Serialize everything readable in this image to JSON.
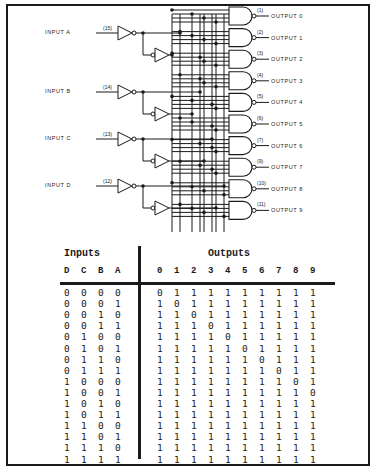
{
  "diagram": {
    "inputs": [
      {
        "label": "INPUT A",
        "pin": "(15)"
      },
      {
        "label": "INPUT B",
        "pin": "(14)"
      },
      {
        "label": "INPUT C",
        "pin": "(13)"
      },
      {
        "label": "INPUT D",
        "pin": "(12)"
      }
    ],
    "outputs": [
      {
        "label": "OUTPUT 0",
        "pin": "(1)"
      },
      {
        "label": "OUTPUT 1",
        "pin": "(2)"
      },
      {
        "label": "OUTPUT 2",
        "pin": "(3)"
      },
      {
        "label": "OUTPUT 3",
        "pin": "(4)"
      },
      {
        "label": "OUTPUT 4",
        "pin": "(5)"
      },
      {
        "label": "OUTPUT 5",
        "pin": "(6)"
      },
      {
        "label": "OUTPUT 6",
        "pin": "(7)"
      },
      {
        "label": "OUTPUT 7",
        "pin": "(9)"
      },
      {
        "label": "OUTPUT 8",
        "pin": "(10)"
      },
      {
        "label": "OUTPUT 9",
        "pin": "(11)"
      }
    ]
  },
  "truth_table": {
    "inputs_title": "Inputs",
    "outputs_title": "Outputs",
    "input_headers": [
      "D",
      "C",
      "B",
      "A"
    ],
    "output_headers": [
      "0",
      "1",
      "2",
      "3",
      "4",
      "5",
      "6",
      "7",
      "8",
      "9"
    ],
    "rows": [
      {
        "in": [
          "0",
          "0",
          "0",
          "0"
        ],
        "out": [
          "0",
          "1",
          "1",
          "1",
          "1",
          "1",
          "1",
          "1",
          "1",
          "1"
        ]
      },
      {
        "in": [
          "0",
          "0",
          "0",
          "1"
        ],
        "out": [
          "1",
          "0",
          "1",
          "1",
          "1",
          "1",
          "1",
          "1",
          "1",
          "1"
        ]
      },
      {
        "in": [
          "0",
          "0",
          "1",
          "0"
        ],
        "out": [
          "1",
          "1",
          "0",
          "1",
          "1",
          "1",
          "1",
          "1",
          "1",
          "1"
        ]
      },
      {
        "in": [
          "0",
          "0",
          "1",
          "1"
        ],
        "out": [
          "1",
          "1",
          "1",
          "0",
          "1",
          "1",
          "1",
          "1",
          "1",
          "1"
        ]
      },
      {
        "in": [
          "0",
          "1",
          "0",
          "0"
        ],
        "out": [
          "1",
          "1",
          "1",
          "1",
          "0",
          "1",
          "1",
          "1",
          "1",
          "1"
        ]
      },
      {
        "in": [
          "0",
          "1",
          "0",
          "1"
        ],
        "out": [
          "1",
          "1",
          "1",
          "1",
          "1",
          "0",
          "1",
          "1",
          "1",
          "1"
        ]
      },
      {
        "in": [
          "0",
          "1",
          "1",
          "0"
        ],
        "out": [
          "1",
          "1",
          "1",
          "1",
          "1",
          "1",
          "0",
          "1",
          "1",
          "1"
        ]
      },
      {
        "in": [
          "0",
          "1",
          "1",
          "1"
        ],
        "out": [
          "1",
          "1",
          "1",
          "1",
          "1",
          "1",
          "1",
          "0",
          "1",
          "1"
        ]
      },
      {
        "in": [
          "1",
          "0",
          "0",
          "0"
        ],
        "out": [
          "1",
          "1",
          "1",
          "1",
          "1",
          "1",
          "1",
          "1",
          "0",
          "1"
        ]
      },
      {
        "in": [
          "1",
          "0",
          "0",
          "1"
        ],
        "out": [
          "1",
          "1",
          "1",
          "1",
          "1",
          "1",
          "1",
          "1",
          "1",
          "0"
        ]
      },
      {
        "in": [
          "1",
          "0",
          "1",
          "0"
        ],
        "out": [
          "1",
          "1",
          "1",
          "1",
          "1",
          "1",
          "1",
          "1",
          "1",
          "1"
        ]
      },
      {
        "in": [
          "1",
          "0",
          "1",
          "1"
        ],
        "out": [
          "1",
          "1",
          "1",
          "1",
          "1",
          "1",
          "1",
          "1",
          "1",
          "1"
        ]
      },
      {
        "in": [
          "1",
          "1",
          "0",
          "0"
        ],
        "out": [
          "1",
          "1",
          "1",
          "1",
          "1",
          "1",
          "1",
          "1",
          "1",
          "1"
        ]
      },
      {
        "in": [
          "1",
          "1",
          "0",
          "1"
        ],
        "out": [
          "1",
          "1",
          "1",
          "1",
          "1",
          "1",
          "1",
          "1",
          "1",
          "1"
        ]
      },
      {
        "in": [
          "1",
          "1",
          "1",
          "0"
        ],
        "out": [
          "1",
          "1",
          "1",
          "1",
          "1",
          "1",
          "1",
          "1",
          "1",
          "1"
        ]
      },
      {
        "in": [
          "1",
          "1",
          "1",
          "1"
        ],
        "out": [
          "1",
          "1",
          "1",
          "1",
          "1",
          "1",
          "1",
          "1",
          "1",
          "1"
        ]
      }
    ]
  }
}
